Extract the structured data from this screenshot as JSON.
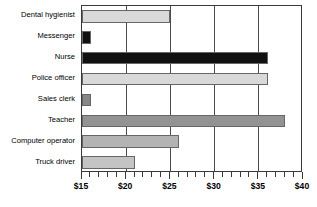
{
  "chart_data": {
    "type": "bar",
    "orientation": "horizontal",
    "title": "",
    "xlabel": "",
    "ylabel": "",
    "xlim": [
      15,
      40
    ],
    "grid": true,
    "legend": "none",
    "major_tick_step": 5,
    "minor_tick_step": 1,
    "xtick_labels": [
      "$15",
      "$20",
      "$25",
      "$30",
      "$35",
      "$40"
    ],
    "xtick_values": [
      15,
      20,
      25,
      30,
      35,
      40
    ],
    "categories": [
      "Dental hygienist",
      "Messenger",
      "Nurse",
      "Police officer",
      "Sales clerk",
      "Teacher",
      "Computer operator",
      "Truck driver"
    ],
    "values": [
      25,
      16,
      36,
      36,
      16,
      38,
      26,
      21
    ],
    "bar_colors": [
      "#d9d9d9",
      "#111111",
      "#111111",
      "#d9d9d9",
      "#888888",
      "#939393",
      "#b3b3b3",
      "#c4c4c4"
    ],
    "bar_edge_color": "#666666",
    "axis_color": "#3a3a3a",
    "gridline_color": "#4a4a4a",
    "background_color": "#ffffff"
  }
}
